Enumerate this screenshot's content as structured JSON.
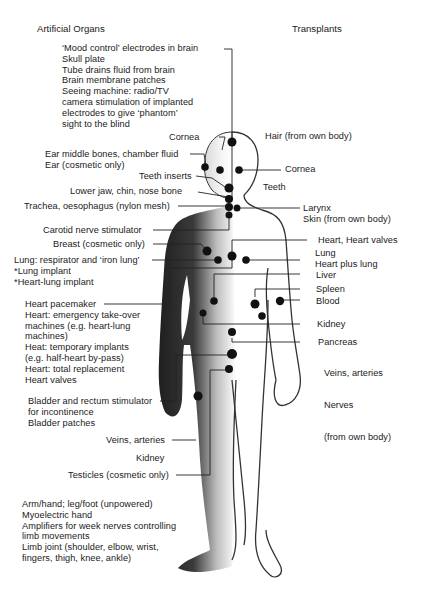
{
  "headings": {
    "left": "Artificial Organs",
    "right": "Transplants"
  },
  "artificial_organs": {
    "brain_block": [
      "‘Mood control’ electrodes in brain",
      "Skull plate",
      "Tube drains fluid from brain",
      "Brain membrane patches",
      "Seeing machine: radio/TV",
      "camera stimulation of implanted",
      "electrodes to give ‘phantom’",
      "sight to the blind"
    ],
    "cornea": "Cornea",
    "ear_block": [
      "Ear middle bones, chamber fluid",
      "Ear (cosmetic only)"
    ],
    "teeth_inserts": "Teeth inserts",
    "lower_jaw": "Lower jaw, chin, nose bone",
    "trachea": "Trachea, oesophagus (nylon mesh)",
    "carotid": "Carotid nerve stimulator",
    "breast": "Breast (cosmetic only)",
    "lung_block": [
      "Lung: respirator and ‘iron lung’",
      "*Lung implant",
      "*Heart-lung implant"
    ],
    "heart_block": [
      "Heart pacemaker",
      "Heart: emergency take-over",
      "machines (e.g. heart-lung",
      "machines)",
      "Heat: temporary implants",
      "(e.g. half-heart by-pass)",
      "Heart: total replacement",
      "Heart valves"
    ],
    "bladder_block": [
      "Bladder and rectum stimulator",
      "for incontinence",
      "Bladder patches"
    ],
    "veins": "Veins, arteries",
    "kidney": "Kidney",
    "testicles": "Testicles (cosmetic only)",
    "limb_block": [
      "Arm/hand; leg/foot (unpowered)",
      "Myoelectric hand",
      "Amplifiers for week nerves controlling",
      "limb movements",
      "Limb joint (shoulder, elbow, wrist,",
      "fingers, thigh, knee, ankle)"
    ]
  },
  "transplants": {
    "hair": "Hair (from own body)",
    "cornea": "Cornea",
    "teeth": "Teeth",
    "larynx_block": [
      "Larynx",
      "Skin (from own body)"
    ],
    "heart": "Heart, Heart valves",
    "lung_block": [
      "Lung",
      "Heart plus lung"
    ],
    "liver": "Liver",
    "spleen": "Spleen",
    "blood": "Blood",
    "kidney": "Kidney",
    "pancreas": "Pancreas",
    "veins": "Veins, arteries",
    "nerves": "Nerves",
    "nerves_note": "(from own body)"
  },
  "colors": {
    "ink": "#1a1a1a",
    "figure_dark": "#2b2b2b",
    "background": "#ffffff"
  }
}
